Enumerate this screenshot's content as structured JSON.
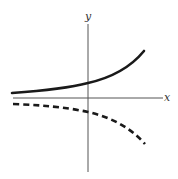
{
  "diagram": {
    "type": "function-graph",
    "axes": {
      "x_label": "x",
      "y_label": "y"
    },
    "curves": [
      {
        "name": "solid-exponential-growth",
        "style": "solid",
        "description": "increasing curve above x-axis, crossing y-axis above origin"
      },
      {
        "name": "dashed-reflection",
        "style": "dashed",
        "description": "decreasing curve below x-axis, mirror of solid curve"
      }
    ],
    "colors": {
      "axis": "#555555",
      "curve": "#1a1a1a"
    }
  }
}
